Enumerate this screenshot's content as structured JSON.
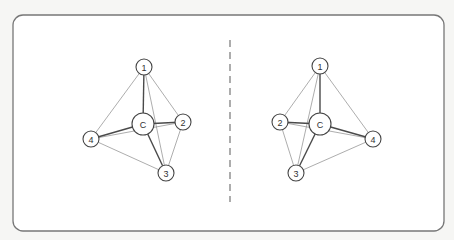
{
  "figure": {
    "frame": {
      "x": 13,
      "y": 15,
      "width": 431,
      "height": 216,
      "radius": 10
    },
    "mirror_line": {
      "x": 230,
      "y1": 40,
      "y2": 202
    },
    "molecules": [
      {
        "id": "left",
        "center": {
          "label": "C",
          "x": 143,
          "y": 124,
          "r": 11
        },
        "vertices": [
          {
            "label": "1",
            "x": 144,
            "y": 67,
            "r": 8
          },
          {
            "label": "2",
            "x": 183,
            "y": 122,
            "r": 8
          },
          {
            "label": "3",
            "x": 166,
            "y": 173,
            "r": 8
          },
          {
            "label": "4",
            "x": 91,
            "y": 139,
            "r": 8
          }
        ]
      },
      {
        "id": "right",
        "center": {
          "label": "C",
          "x": 320,
          "y": 124,
          "r": 11
        },
        "vertices": [
          {
            "label": "1",
            "x": 320,
            "y": 66,
            "r": 8
          },
          {
            "label": "2",
            "x": 280,
            "y": 122,
            "r": 8
          },
          {
            "label": "3",
            "x": 296,
            "y": 173,
            "r": 8
          },
          {
            "label": "4",
            "x": 373,
            "y": 139,
            "r": 8
          }
        ]
      }
    ],
    "bonds": [
      [
        "C",
        "1"
      ],
      [
        "C",
        "2"
      ],
      [
        "C",
        "3"
      ],
      [
        "C",
        "4"
      ]
    ],
    "edges": [
      [
        "1",
        "2"
      ],
      [
        "1",
        "3"
      ],
      [
        "1",
        "4"
      ],
      [
        "2",
        "3"
      ],
      [
        "2",
        "4"
      ],
      [
        "3",
        "4"
      ]
    ]
  }
}
